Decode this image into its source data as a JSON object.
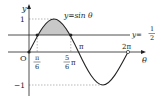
{
  "figure": {
    "curve_label": "y=sin θ",
    "line_label_prefix": "y=",
    "line_label_num": "1",
    "line_label_den": "2",
    "y_axis_label": "y",
    "x_axis_label": "θ",
    "origin_label": "O",
    "y_tick_1": "1",
    "y_tick_neg1": "−1",
    "x_tick_pi6_num": "π",
    "x_tick_pi6_den": "6",
    "x_tick_5pi6_num": "5",
    "x_tick_5pi6_den": "6",
    "x_tick_5pi6_suffix": "π",
    "x_tick_pi": "π",
    "x_tick_2pi": "2π"
  },
  "colors": {
    "curve": "#222222",
    "shade": "#c8c8c8",
    "dashed": "#888888"
  }
}
